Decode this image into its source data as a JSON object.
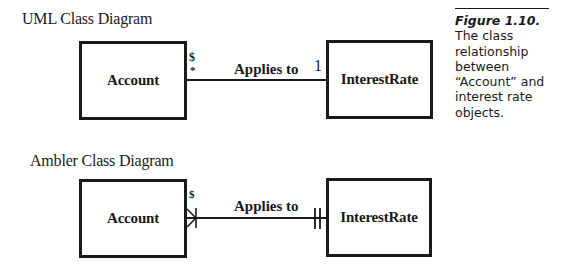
{
  "figure": {
    "number": "Figure 1.10.",
    "caption_lines": [
      "The class",
      "relationship",
      "between",
      "“Account” and",
      "interest rate",
      "objects."
    ]
  },
  "uml_diagram": {
    "heading": "UML Class Diagram",
    "source_class": "Account",
    "target_class": "InterestRate",
    "association_label": "Applies to",
    "source_marks": [
      "$",
      "*"
    ],
    "target_multiplicity": "1"
  },
  "ambler_diagram": {
    "heading": "Ambler Class Diagram",
    "source_class": "Account",
    "target_class": "InterestRate",
    "association_label": "Applies to",
    "source_marks": [
      "$"
    ],
    "source_notation": "crows-foot-many",
    "target_notation": "double-bar-exactly-one"
  }
}
